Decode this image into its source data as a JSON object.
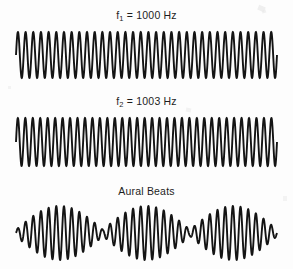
{
  "figure": {
    "background_color": "#fdfdfd",
    "stroke_color": "#141414",
    "width": 293,
    "height": 269
  },
  "panels": [
    {
      "id": "tone-1",
      "label_prefix": "f",
      "label_subscript": "1",
      "label_suffix": " = 1000 Hz",
      "label_text": "f1 = 1000 Hz",
      "frequency_hz": 1000,
      "waveform": "sine",
      "cycles": 34,
      "amplitude_px": 23
    },
    {
      "id": "tone-2",
      "label_prefix": "f",
      "label_subscript": "2",
      "label_suffix": " = 1003 Hz",
      "label_text": "f2 = 1003 Hz",
      "frequency_hz": 1003,
      "waveform": "sine",
      "cycles": 35,
      "amplitude_px": 24
    },
    {
      "id": "beats",
      "label_text": "Aural Beats",
      "beat_frequency_hz": 3,
      "waveform": "amplitude-modulated sine",
      "carrier_cycles": 34,
      "beat_count": 3,
      "amplitude_px": 27
    }
  ],
  "chart_data": {
    "type": "line",
    "title": "Aural Beats",
    "xlabel": "",
    "ylabel": "",
    "grid": false,
    "legend_position": "above-each-panel",
    "series": [
      {
        "name": "f1 = 1000 Hz",
        "frequency_hz": 1000,
        "amplitude": 1.0,
        "cycles_drawn": 34,
        "annotation": "f1 = 1000 Hz"
      },
      {
        "name": "f2 = 1003 Hz",
        "frequency_hz": 1003,
        "amplitude": 1.0,
        "cycles_drawn": 35,
        "annotation": "f2 = 1003 Hz"
      },
      {
        "name": "Aural Beats",
        "frequency_hz": 1001.5,
        "beat_frequency_hz": 3,
        "amplitude": 2.0,
        "cycles_drawn": 34,
        "beats_drawn": 3,
        "annotation": "Aural Beats"
      }
    ],
    "xlim": [
      0,
      1
    ],
    "ylim": [
      -2,
      2
    ]
  }
}
